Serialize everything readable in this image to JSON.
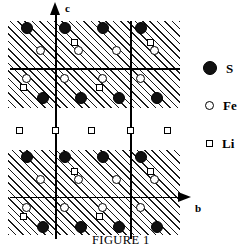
{
  "figure": {
    "caption": "FIGURE 1",
    "axes": {
      "vertical_label": "c",
      "horizontal_label": "b"
    }
  },
  "legend": {
    "items": [
      {
        "symbol": "filled-circle",
        "label": "S",
        "color": "#111111"
      },
      {
        "symbol": "open-circle",
        "label": "Fe",
        "color": "#ffffff"
      },
      {
        "symbol": "open-square",
        "label": "Li",
        "color": "#ffffff"
      }
    ]
  },
  "diagram": {
    "type": "crystal-structure-projection",
    "bands": [
      {
        "name": "upper-hatched-slab",
        "x": 8,
        "y": 21,
        "width": 172,
        "height": 87
      },
      {
        "name": "lower-hatched-slab",
        "x": 8,
        "y": 150,
        "width": 172,
        "height": 85
      }
    ],
    "lattice_lines": {
      "vertical": [
        55,
        130
      ],
      "horizontal": [
        68,
        197
      ]
    },
    "atoms": {
      "S": [
        {
          "x": 27,
          "y": 28
        },
        {
          "x": 65,
          "y": 28
        },
        {
          "x": 103,
          "y": 28
        },
        {
          "x": 141,
          "y": 28
        },
        {
          "x": 43,
          "y": 98
        },
        {
          "x": 81,
          "y": 98
        },
        {
          "x": 119,
          "y": 98
        },
        {
          "x": 157,
          "y": 98
        },
        {
          "x": 27,
          "y": 157
        },
        {
          "x": 65,
          "y": 157
        },
        {
          "x": 103,
          "y": 157
        },
        {
          "x": 141,
          "y": 157
        },
        {
          "x": 43,
          "y": 227
        },
        {
          "x": 81,
          "y": 227
        },
        {
          "x": 119,
          "y": 227
        },
        {
          "x": 157,
          "y": 227
        }
      ],
      "Fe": [
        {
          "x": 40,
          "y": 50
        },
        {
          "x": 78,
          "y": 50
        },
        {
          "x": 116,
          "y": 50
        },
        {
          "x": 154,
          "y": 50
        },
        {
          "x": 26,
          "y": 78
        },
        {
          "x": 64,
          "y": 78
        },
        {
          "x": 102,
          "y": 78
        },
        {
          "x": 140,
          "y": 78
        },
        {
          "x": 40,
          "y": 179
        },
        {
          "x": 78,
          "y": 179
        },
        {
          "x": 116,
          "y": 179
        },
        {
          "x": 154,
          "y": 179
        },
        {
          "x": 26,
          "y": 207
        },
        {
          "x": 64,
          "y": 207
        },
        {
          "x": 102,
          "y": 207
        },
        {
          "x": 140,
          "y": 207
        }
      ],
      "Li": [
        {
          "x": 74,
          "y": 42
        },
        {
          "x": 150,
          "y": 42
        },
        {
          "x": 23,
          "y": 87
        },
        {
          "x": 99,
          "y": 87
        },
        {
          "x": 19,
          "y": 130
        },
        {
          "x": 55,
          "y": 130
        },
        {
          "x": 91,
          "y": 130
        },
        {
          "x": 130,
          "y": 130
        },
        {
          "x": 167,
          "y": 130
        },
        {
          "x": 74,
          "y": 171
        },
        {
          "x": 150,
          "y": 171
        },
        {
          "x": 23,
          "y": 216
        },
        {
          "x": 99,
          "y": 216
        }
      ]
    }
  }
}
